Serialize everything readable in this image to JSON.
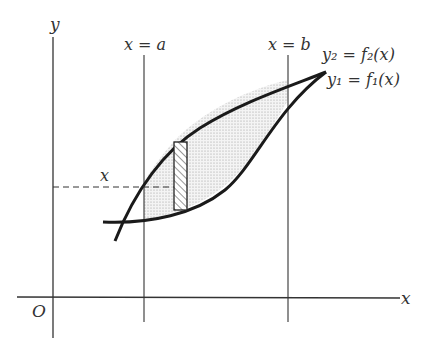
{
  "diagram": {
    "axes": {
      "x_label": "x",
      "y_label": "y",
      "origin_label": "O"
    },
    "boundaries": {
      "left": "x = a",
      "right": "x = b"
    },
    "curves": [
      {
        "name": "upper-curve",
        "label": "y₂ = f₂(x)"
      },
      {
        "name": "lower-curve",
        "label": "y₁ = f₁(x)"
      }
    ],
    "strip": {
      "label": "x",
      "style": "hatched"
    },
    "colors": {
      "ink": "#222222",
      "shade": "#dcdcdc",
      "background": "#ffffff"
    }
  }
}
